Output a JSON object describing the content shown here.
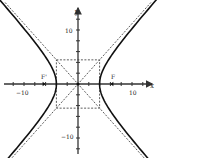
{
  "diagram": {
    "type": "hyperbola",
    "equation": "x^2/16 - y^2/20 = 1",
    "a": 4,
    "b": 4.472,
    "c": 6,
    "axes": {
      "x_label": "x",
      "y_label": "y",
      "x_tick_labels": [
        {
          "value": -10,
          "text": "−10"
        },
        {
          "value": 10,
          "text": "10"
        }
      ],
      "y_tick_labels": [
        {
          "value": 10,
          "text": "10"
        },
        {
          "value": -10,
          "text": "−10"
        }
      ],
      "tick_step": 2,
      "range": [
        -14,
        14
      ]
    },
    "foci": [
      {
        "label": "F'",
        "x": -6,
        "y": 0
      },
      {
        "label": "F",
        "x": 6,
        "y": 0
      }
    ],
    "vertices": [
      {
        "x": -4,
        "y": 0
      },
      {
        "x": 4,
        "y": 0
      }
    ],
    "asymptotes": [
      "y = (b/a)x",
      "y = -(b/a)x"
    ],
    "central_rectangle": {
      "x": [
        -4,
        4
      ],
      "y": [
        -4.472,
        4.472
      ]
    },
    "colors": {
      "curve": "#111111",
      "axes": "#333333",
      "dashed": "#333333",
      "background": "#ffffff"
    }
  }
}
